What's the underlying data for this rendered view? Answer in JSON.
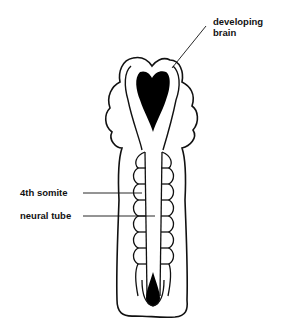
{
  "diagram": {
    "labels": {
      "brain_line1": "developing",
      "brain_line2": "brain",
      "somite": "4th somite",
      "neural_tube": "neural tube"
    },
    "colors": {
      "line": "#111111",
      "fill": "#000000",
      "background": "#ffffff"
    }
  }
}
